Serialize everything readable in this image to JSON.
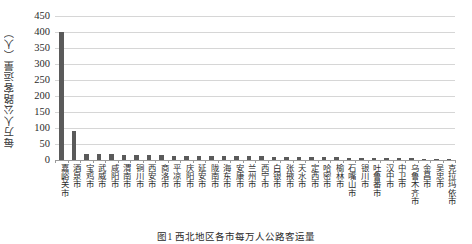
{
  "chart_data": {
    "type": "bar",
    "title": "",
    "xlabel": "",
    "ylabel": "每万人公路客运量（人）",
    "ylim": [
      0,
      450
    ],
    "yticks": [
      450,
      400,
      350,
      300,
      250,
      200,
      150,
      100,
      50,
      0
    ],
    "grid": true,
    "legend": null,
    "bar_color": "#5a5a5a",
    "grid_color": "#d6d6d6",
    "categories": [
      "嘉峪关市",
      "酒泉市",
      "宝鸡市",
      "武威市",
      "咸阳市",
      "渭南市",
      "铜川市",
      "西安市",
      "商洛市",
      "平凉市",
      "庆阳市",
      "延安市",
      "陇南市",
      "海东市",
      "安康市",
      "兰州市",
      "西宁市",
      "白银市",
      "张掖市",
      "天水市",
      "定西市",
      "哈密市",
      "榆林市",
      "石嘴山市",
      "银川市",
      "吐鲁番市",
      "汉中市",
      "中卫市",
      "乌鲁木齐市",
      "金昌市",
      "吴忠市",
      "克拉玛依市"
    ],
    "values": [
      399,
      92,
      20,
      19,
      18,
      17,
      16,
      16,
      15,
      14,
      14,
      13,
      13,
      12,
      12,
      11,
      11,
      10,
      10,
      9,
      9,
      8,
      8,
      7,
      7,
      6,
      6,
      5,
      5,
      4,
      4,
      3
    ]
  },
  "caption": {
    "text": "图1 西北地区各市每万人公路客运量"
  }
}
